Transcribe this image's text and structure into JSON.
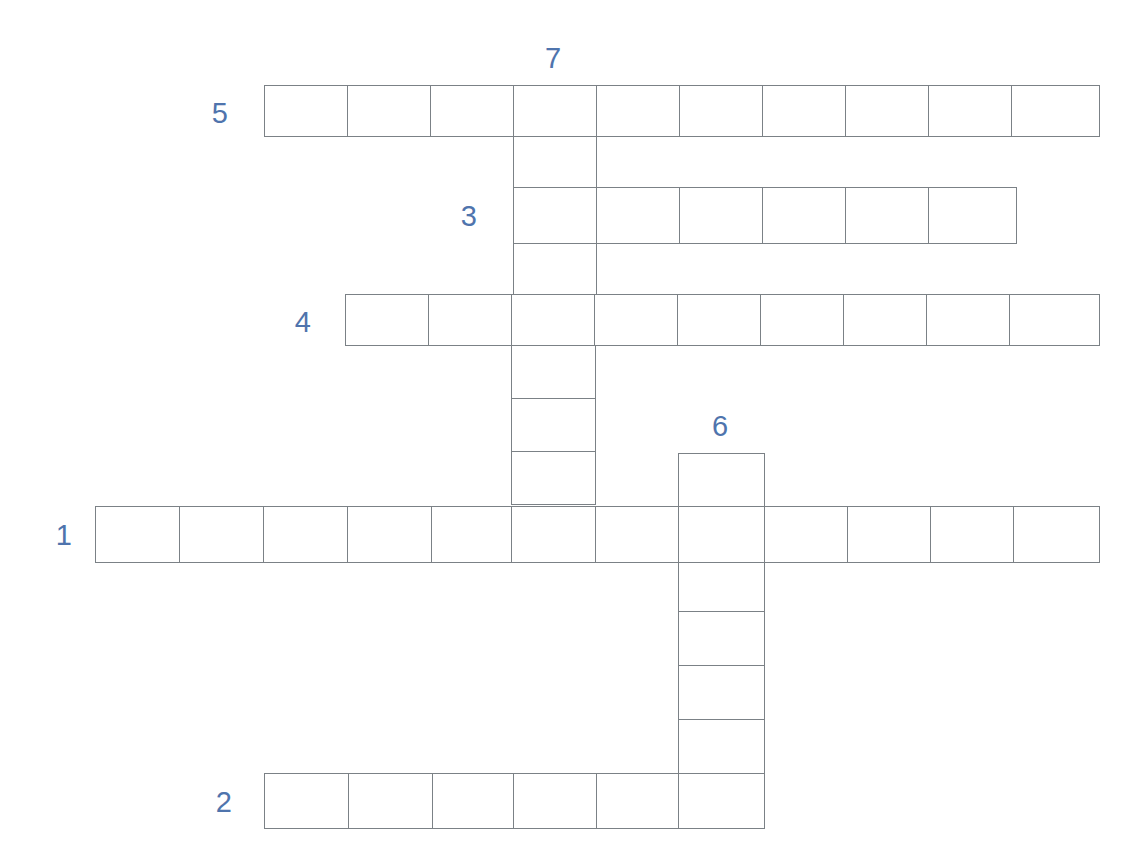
{
  "puzzle": {
    "title": "Crossword Puzzle Grid",
    "background_color": "#ffffff",
    "cell_line_color": "#7b8186",
    "clue_number_color": "#4f74ad",
    "cell_size": 83.6,
    "grid_origin": {
      "x": 95,
      "y": 85
    },
    "letter_values": {
      "all_empty": true,
      "note": "All cells are blank — unsolved puzzle"
    },
    "clue_numbers": [
      {
        "id": "clue-number-5",
        "label": "5",
        "x": 228,
        "y": 113,
        "placement": "left-of"
      },
      {
        "id": "clue-number-7",
        "label": "7",
        "x": 553,
        "y": 73,
        "placement": "above-of"
      },
      {
        "id": "clue-number-3",
        "label": "3",
        "x": 477,
        "y": 216,
        "placement": "left-of"
      },
      {
        "id": "clue-number-4",
        "label": "4",
        "x": 311,
        "y": 322,
        "placement": "left-of"
      },
      {
        "id": "clue-number-6",
        "label": "6",
        "x": 720,
        "y": 441,
        "placement": "above-of"
      },
      {
        "id": "clue-number-1",
        "label": "1",
        "x": 72,
        "y": 535,
        "placement": "left-of"
      },
      {
        "id": "clue-number-2",
        "label": "2",
        "x": 232,
        "y": 802,
        "placement": "left-of"
      }
    ],
    "entries": [
      {
        "id": "entry-5-across",
        "number": "5",
        "direction": "across",
        "length": 10,
        "start_col": 2,
        "start_row": 0,
        "cells": [
          "",
          "",
          "",
          "",
          "",
          "",
          "",
          "",
          "",
          ""
        ]
      },
      {
        "id": "entry-3-across",
        "number": "3",
        "direction": "across",
        "length": 6,
        "start_col": 5,
        "start_row": 1,
        "cells": [
          "",
          "",
          "",
          "",
          "",
          ""
        ]
      },
      {
        "id": "entry-4-across",
        "number": "4",
        "direction": "across",
        "length": 9,
        "start_col": 3,
        "start_row": 2,
        "cells": [
          "",
          "",
          "",
          "",
          "",
          "",
          "",
          "",
          ""
        ]
      },
      {
        "id": "entry-1-across",
        "number": "1",
        "direction": "across",
        "length": 12,
        "start_col": 0,
        "start_row": 5,
        "cells": [
          "",
          "",
          "",
          "",
          "",
          "",
          "",
          "",
          "",
          "",
          "",
          ""
        ]
      },
      {
        "id": "entry-2-across",
        "number": "2",
        "direction": "across",
        "length": 6,
        "start_col": 2,
        "start_row": 9,
        "cells": [
          "",
          "",
          "",
          "",
          "",
          ""
        ]
      },
      {
        "id": "entry-7-down",
        "number": "7",
        "direction": "down",
        "length": 8,
        "start_col": 5,
        "start_row": 0,
        "cells": [
          "",
          "",
          "",
          "",
          "",
          "",
          "",
          ""
        ]
      },
      {
        "id": "entry-6-down",
        "number": "6",
        "direction": "down",
        "length": 6,
        "start_col": 7,
        "start_row": 4,
        "cells": [
          "",
          "",
          "",
          "",
          "",
          ""
        ]
      }
    ],
    "cells": [
      {
        "id": "c-r5-0",
        "x": 264,
        "y": 85,
        "w": 84,
        "h": 52,
        "entry": "5-across",
        "index": 0,
        "letter": ""
      },
      {
        "id": "c-r5-1",
        "x": 347,
        "y": 85,
        "w": 84,
        "h": 52,
        "entry": "5-across",
        "index": 1,
        "letter": ""
      },
      {
        "id": "c-r5-2",
        "x": 430,
        "y": 85,
        "w": 84,
        "h": 52,
        "entry": "5-across",
        "index": 2,
        "letter": ""
      },
      {
        "id": "c-r5-3",
        "x": 513,
        "y": 85,
        "w": 84,
        "h": 52,
        "entry": "5-across",
        "index": 3,
        "letter": ""
      },
      {
        "id": "c-r5-4",
        "x": 596,
        "y": 85,
        "w": 84,
        "h": 52,
        "entry": "5-across",
        "index": 4,
        "letter": ""
      },
      {
        "id": "c-r5-5",
        "x": 679,
        "y": 85,
        "w": 84,
        "h": 52,
        "entry": "5-across",
        "index": 5,
        "letter": ""
      },
      {
        "id": "c-r5-6",
        "x": 762,
        "y": 85,
        "w": 84,
        "h": 52,
        "entry": "5-across",
        "index": 6,
        "letter": ""
      },
      {
        "id": "c-r5-7",
        "x": 845,
        "y": 85,
        "w": 84,
        "h": 52,
        "entry": "5-across",
        "index": 7,
        "letter": ""
      },
      {
        "id": "c-r5-8",
        "x": 928,
        "y": 85,
        "w": 84,
        "h": 52,
        "entry": "5-across",
        "index": 8,
        "letter": ""
      },
      {
        "id": "c-r5-9",
        "x": 1011,
        "y": 85,
        "w": 89,
        "h": 52,
        "entry": "5-across",
        "index": 9,
        "letter": ""
      },
      {
        "id": "c-7d-1",
        "x": 513,
        "y": 136,
        "w": 84,
        "h": 52,
        "entry": "7-down",
        "index": 1,
        "letter": ""
      },
      {
        "id": "c-r3-0",
        "x": 513,
        "y": 187,
        "w": 84,
        "h": 57,
        "entry": "3-across",
        "index": 0,
        "letter": ""
      },
      {
        "id": "c-r3-1",
        "x": 596,
        "y": 187,
        "w": 84,
        "h": 57,
        "entry": "3-across",
        "index": 1,
        "letter": ""
      },
      {
        "id": "c-r3-2",
        "x": 679,
        "y": 187,
        "w": 84,
        "h": 57,
        "entry": "3-across",
        "index": 2,
        "letter": ""
      },
      {
        "id": "c-r3-3",
        "x": 762,
        "y": 187,
        "w": 84,
        "h": 57,
        "entry": "3-across",
        "index": 3,
        "letter": ""
      },
      {
        "id": "c-r3-4",
        "x": 845,
        "y": 187,
        "w": 84,
        "h": 57,
        "entry": "3-across",
        "index": 4,
        "letter": ""
      },
      {
        "id": "c-r3-5",
        "x": 928,
        "y": 187,
        "w": 89,
        "h": 57,
        "entry": "3-across",
        "index": 5,
        "letter": ""
      },
      {
        "id": "c-7d-3",
        "x": 513,
        "y": 243,
        "w": 84,
        "h": 52,
        "entry": "7-down",
        "index": 3,
        "letter": ""
      },
      {
        "id": "c-r4-0",
        "x": 345,
        "y": 294,
        "w": 84,
        "h": 52,
        "entry": "4-across",
        "index": 0,
        "letter": ""
      },
      {
        "id": "c-r4-1",
        "x": 428,
        "y": 294,
        "w": 84,
        "h": 52,
        "entry": "4-across",
        "index": 1,
        "letter": ""
      },
      {
        "id": "c-r4-2",
        "x": 511,
        "y": 294,
        "w": 84,
        "h": 52,
        "entry": "4-across",
        "index": 2,
        "letter": ""
      },
      {
        "id": "c-r4-3",
        "x": 594,
        "y": 294,
        "w": 84,
        "h": 52,
        "entry": "4-across",
        "index": 3,
        "letter": ""
      },
      {
        "id": "c-r4-4",
        "x": 677,
        "y": 294,
        "w": 84,
        "h": 52,
        "entry": "4-across",
        "index": 4,
        "letter": ""
      },
      {
        "id": "c-r4-5",
        "x": 760,
        "y": 294,
        "w": 84,
        "h": 52,
        "entry": "4-across",
        "index": 5,
        "letter": ""
      },
      {
        "id": "c-r4-6",
        "x": 843,
        "y": 294,
        "w": 84,
        "h": 52,
        "entry": "4-across",
        "index": 6,
        "letter": ""
      },
      {
        "id": "c-r4-7",
        "x": 926,
        "y": 294,
        "w": 84,
        "h": 52,
        "entry": "4-across",
        "index": 7,
        "letter": ""
      },
      {
        "id": "c-r4-8",
        "x": 1009,
        "y": 294,
        "w": 91,
        "h": 52,
        "entry": "4-across",
        "index": 8,
        "letter": ""
      },
      {
        "id": "c-7d-5",
        "x": 511,
        "y": 345,
        "w": 85,
        "h": 54,
        "entry": "7-down",
        "index": 5,
        "letter": ""
      },
      {
        "id": "c-7d-6",
        "x": 511,
        "y": 398,
        "w": 85,
        "h": 54,
        "entry": "7-down",
        "index": 6,
        "letter": ""
      },
      {
        "id": "c-7d-7",
        "x": 511,
        "y": 451,
        "w": 85,
        "h": 54,
        "entry": "7-down",
        "index": 7,
        "letter": ""
      },
      {
        "id": "c-6d-0",
        "x": 678,
        "y": 453,
        "w": 87,
        "h": 55,
        "entry": "6-down",
        "index": 0,
        "letter": ""
      },
      {
        "id": "c-r1-0",
        "x": 95,
        "y": 506,
        "w": 85,
        "h": 57,
        "entry": "1-across",
        "index": 0,
        "letter": ""
      },
      {
        "id": "c-r1-1",
        "x": 179,
        "y": 506,
        "w": 85,
        "h": 57,
        "entry": "1-across",
        "index": 1,
        "letter": ""
      },
      {
        "id": "c-r1-2",
        "x": 263,
        "y": 506,
        "w": 85,
        "h": 57,
        "entry": "1-across",
        "index": 2,
        "letter": ""
      },
      {
        "id": "c-r1-3",
        "x": 347,
        "y": 506,
        "w": 85,
        "h": 57,
        "entry": "1-across",
        "index": 3,
        "letter": ""
      },
      {
        "id": "c-r1-4",
        "x": 431,
        "y": 506,
        "w": 81,
        "h": 57,
        "entry": "1-across",
        "index": 4,
        "letter": ""
      },
      {
        "id": "c-r1-5",
        "x": 511,
        "y": 506,
        "w": 85,
        "h": 57,
        "entry": "1-across",
        "index": 5,
        "letter": ""
      },
      {
        "id": "c-r1-6",
        "x": 595,
        "y": 506,
        "w": 84,
        "h": 57,
        "entry": "1-across",
        "index": 6,
        "letter": ""
      },
      {
        "id": "c-r1-7",
        "x": 678,
        "y": 506,
        "w": 87,
        "h": 57,
        "entry": "1-across",
        "index": 7,
        "letter": ""
      },
      {
        "id": "c-r1-8",
        "x": 764,
        "y": 506,
        "w": 84,
        "h": 57,
        "entry": "1-across",
        "index": 8,
        "letter": ""
      },
      {
        "id": "c-r1-9",
        "x": 847,
        "y": 506,
        "w": 84,
        "h": 57,
        "entry": "1-across",
        "index": 9,
        "letter": ""
      },
      {
        "id": "c-r1-10",
        "x": 930,
        "y": 506,
        "w": 84,
        "h": 57,
        "entry": "1-across",
        "index": 10,
        "letter": ""
      },
      {
        "id": "c-r1-11",
        "x": 1013,
        "y": 506,
        "w": 87,
        "h": 57,
        "entry": "1-across",
        "index": 11,
        "letter": ""
      },
      {
        "id": "c-6d-2",
        "x": 678,
        "y": 562,
        "w": 87,
        "h": 50,
        "entry": "6-down",
        "index": 2,
        "letter": ""
      },
      {
        "id": "c-6d-3",
        "x": 678,
        "y": 611,
        "w": 87,
        "h": 55,
        "entry": "6-down",
        "index": 3,
        "letter": ""
      },
      {
        "id": "c-6d-4",
        "x": 678,
        "y": 665,
        "w": 87,
        "h": 55,
        "entry": "6-down",
        "index": 4,
        "letter": ""
      },
      {
        "id": "c-6d-5",
        "x": 678,
        "y": 719,
        "w": 87,
        "h": 55,
        "entry": "6-down",
        "index": 5,
        "letter": ""
      },
      {
        "id": "c-r2-0",
        "x": 264,
        "y": 773,
        "w": 85,
        "h": 56,
        "entry": "2-across",
        "index": 0,
        "letter": ""
      },
      {
        "id": "c-r2-1",
        "x": 348,
        "y": 773,
        "w": 85,
        "h": 56,
        "entry": "2-across",
        "index": 1,
        "letter": ""
      },
      {
        "id": "c-r2-2",
        "x": 432,
        "y": 773,
        "w": 82,
        "h": 56,
        "entry": "2-across",
        "index": 2,
        "letter": ""
      },
      {
        "id": "c-r2-3",
        "x": 513,
        "y": 773,
        "w": 84,
        "h": 56,
        "entry": "2-across",
        "index": 3,
        "letter": ""
      },
      {
        "id": "c-r2-4",
        "x": 596,
        "y": 773,
        "w": 83,
        "h": 56,
        "entry": "2-across",
        "index": 4,
        "letter": ""
      },
      {
        "id": "c-r2-5",
        "x": 678,
        "y": 773,
        "w": 87,
        "h": 56,
        "entry": "2-across",
        "index": 5,
        "letter": ""
      }
    ]
  }
}
